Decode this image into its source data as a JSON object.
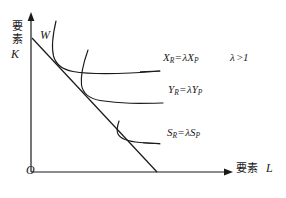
{
  "figure": {
    "type": "economics-isoquant-diagram",
    "background_color": "#ffffff",
    "ink_color": "#1a1a1a"
  },
  "axes": {
    "y": {
      "caption_cjk_char1": "要",
      "caption_cjk_char2": "素",
      "variable": "K"
    },
    "x": {
      "caption_cjk": "要素",
      "variable": "L"
    },
    "origin_label": "O"
  },
  "budget_line": {
    "endpoint_label": "W",
    "description": "downward sloping isocost line"
  },
  "curves": [
    {
      "name": "isoquant-x",
      "label": {
        "lhs_var": "X",
        "lhs_sub": "R",
        "operator": "=",
        "lambda": "λ",
        "rhs_var": "X",
        "rhs_sub": "P"
      }
    },
    {
      "name": "isoquant-y",
      "label": {
        "lhs_var": "Y",
        "lhs_sub": "R",
        "operator": "=",
        "lambda": "λ",
        "rhs_var": "Y",
        "rhs_sub": "P"
      }
    },
    {
      "name": "isoquant-s",
      "label": {
        "lhs_var": "S",
        "lhs_sub": "R",
        "operator": "=",
        "lambda": "λ",
        "rhs_var": "S",
        "rhs_sub": "P"
      }
    }
  ],
  "condition": {
    "lambda": "λ",
    "operator": ">",
    "value": "1"
  }
}
